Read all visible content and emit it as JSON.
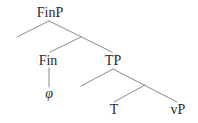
{
  "diagram": {
    "type": "syntax-tree",
    "colors": {
      "line": "#8a8a8a",
      "text": "#2a2a2a",
      "background": "#ffffff"
    },
    "nodes": {
      "finp": {
        "label": "FinP"
      },
      "fin": {
        "label": "Fin"
      },
      "phi": {
        "label": "φ"
      },
      "tp": {
        "label": "TP"
      },
      "t": {
        "label": "T"
      },
      "vp": {
        "label": "vP"
      }
    },
    "edges": [
      {
        "from": "FinP",
        "to": "(empty specifier)"
      },
      {
        "from": "FinP",
        "to": "TP"
      },
      {
        "from": "FinP-bar",
        "to": "Fin"
      },
      {
        "from": "Fin",
        "to": "φ"
      },
      {
        "from": "TP",
        "to": "(empty specifier)"
      },
      {
        "from": "TP",
        "to": "vP"
      },
      {
        "from": "TP-bar",
        "to": "T"
      }
    ]
  }
}
